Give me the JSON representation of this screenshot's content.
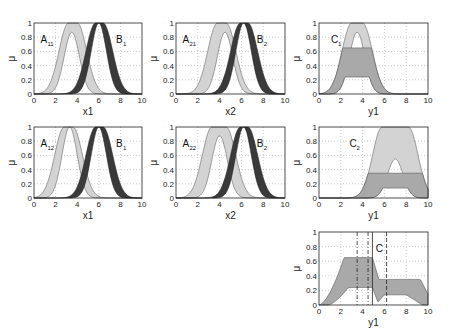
{
  "figure": {
    "ylabel": "μ",
    "x_ticks": [
      "0",
      "2",
      "4",
      "6",
      "8",
      "10"
    ],
    "y_ticks": [
      "0",
      "0.2",
      "0.4",
      "0.6",
      "0.8",
      "1"
    ]
  },
  "chart_data": [
    {
      "type": "area",
      "title": "",
      "panel": "row1-col1",
      "xlabel": "x1",
      "ylabel": "μ",
      "xlim": [
        0,
        10
      ],
      "ylim": [
        0,
        1
      ],
      "grid": true,
      "series": [
        {
          "name": "A11",
          "label_main": "A",
          "label_sub": "11",
          "color": "#d3d3d3",
          "upper_peak": [
            3.2,
            4.0
          ],
          "lower_peak": 3.5,
          "lower_height": 0.87
        },
        {
          "name": "B1",
          "label_main": "B",
          "label_sub": "1",
          "color": "#3a3a3a",
          "upper_peak": [
            5.7,
            6.4
          ],
          "lower_peak": 6.0,
          "lower_height": 1.0
        }
      ]
    },
    {
      "type": "area",
      "title": "",
      "panel": "row1-col2",
      "xlabel": "x2",
      "ylabel": "μ",
      "xlim": [
        0,
        10
      ],
      "ylim": [
        0,
        1
      ],
      "grid": true,
      "series": [
        {
          "name": "A21",
          "label_main": "A",
          "label_sub": "21",
          "color": "#d3d3d3",
          "upper_peak": [
            3.8,
            4.6
          ],
          "lower_peak": 4.5,
          "lower_height": 0.87
        },
        {
          "name": "B2",
          "label_main": "B",
          "label_sub": "2",
          "color": "#3a3a3a",
          "upper_peak": [
            5.9,
            6.6
          ],
          "lower_peak": 6.2,
          "lower_height": 1.0
        }
      ]
    },
    {
      "type": "area",
      "title": "",
      "panel": "row1-col3",
      "xlabel": "y1",
      "ylabel": "μ",
      "xlim": [
        0,
        10
      ],
      "ylim": [
        0,
        1
      ],
      "grid": true,
      "series": [
        {
          "name": "C1",
          "label_main": "C",
          "label_sub": "1",
          "color": "#d3d3d3",
          "upper_peak": [
            3.0,
            4.0
          ],
          "lower_peak": 3.5,
          "lower_height": 0.87,
          "firing_upper": 0.65,
          "firing_lower": 0.24
        }
      ]
    },
    {
      "type": "area",
      "title": "",
      "panel": "row2-col1",
      "xlabel": "x1",
      "ylabel": "μ",
      "xlim": [
        0,
        10
      ],
      "ylim": [
        0,
        1
      ],
      "grid": true,
      "series": [
        {
          "name": "A12",
          "label_main": "A",
          "label_sub": "12",
          "color": "#d3d3d3",
          "upper_peak": [
            2.8,
            3.6
          ],
          "lower_peak": 3.3,
          "lower_height": 1.0
        },
        {
          "name": "B1",
          "label_main": "B",
          "label_sub": "1",
          "color": "#3a3a3a",
          "upper_peak": [
            5.7,
            6.4
          ],
          "lower_peak": 6.0,
          "lower_height": 1.0
        }
      ]
    },
    {
      "type": "area",
      "title": "",
      "panel": "row2-col2",
      "xlabel": "x2",
      "ylabel": "μ",
      "xlim": [
        0,
        10
      ],
      "ylim": [
        0,
        1
      ],
      "grid": true,
      "series": [
        {
          "name": "A22",
          "label_main": "A",
          "label_sub": "22",
          "color": "#d3d3d3",
          "upper_peak": [
            3.3,
            4.6
          ],
          "lower_peak": 4.0,
          "lower_height": 0.88
        },
        {
          "name": "B2",
          "label_main": "B",
          "label_sub": "2",
          "color": "#3a3a3a",
          "upper_peak": [
            5.9,
            6.6
          ],
          "lower_peak": 6.2,
          "lower_height": 1.0
        }
      ]
    },
    {
      "type": "area",
      "title": "",
      "panel": "row2-col3",
      "xlabel": "y1",
      "ylabel": "μ",
      "xlim": [
        0,
        10
      ],
      "ylim": [
        0,
        1
      ],
      "grid": true,
      "series": [
        {
          "name": "C2",
          "label_main": "C",
          "label_sub": "2",
          "color": "#d3d3d3",
          "upper_peak": [
            5.8,
            8.2
          ],
          "lower_peak": 7.0,
          "lower_height": 0.55,
          "firing_upper": 0.35,
          "firing_lower": 0.14
        }
      ]
    },
    {
      "type": "area",
      "title": "",
      "panel": "row3-col3",
      "xlabel": "y1",
      "ylabel": "μ",
      "xlim": [
        0,
        10
      ],
      "ylim": [
        0,
        1
      ],
      "grid": true,
      "series": [
        {
          "name": "C",
          "label_main": "C",
          "label_sub": "",
          "color": "#a9a9a9",
          "upper_level_left": 0.65,
          "upper_level_right": 0.35,
          "lower_level_left": 0.24,
          "lower_level_right": 0.14
        }
      ],
      "vertical_lines": [
        {
          "x": 4.9,
          "style": "solid"
        },
        {
          "x": 3.5,
          "style": "dashdot"
        },
        {
          "x": 4.5,
          "style": "dashdot"
        },
        {
          "x": 6.2,
          "style": "dashed"
        }
      ]
    }
  ]
}
